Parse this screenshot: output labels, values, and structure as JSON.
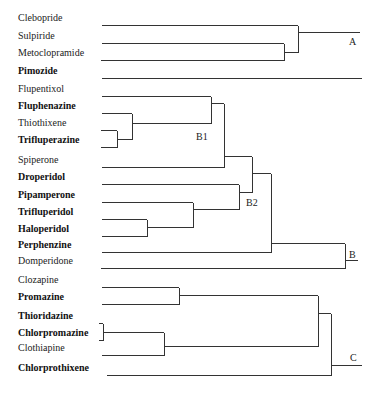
{
  "diagram": {
    "type": "dendrogram",
    "leaves": [
      {
        "name": "Clebopride",
        "bold": false,
        "y": 25
      },
      {
        "name": "Sulpiride",
        "bold": false,
        "y": 43
      },
      {
        "name": "Metoclopramide",
        "bold": false,
        "y": 60
      },
      {
        "name": "Pimozide",
        "bold": true,
        "y": 78
      },
      {
        "name": "Flupentixol",
        "bold": false,
        "y": 96
      },
      {
        "name": "Fluphenazine",
        "bold": true,
        "y": 113
      },
      {
        "name": "Thiothixene",
        "bold": false,
        "y": 130
      },
      {
        "name": "Trifluperazine",
        "bold": true,
        "y": 147
      },
      {
        "name": "Spiperone",
        "bold": false,
        "y": 167
      },
      {
        "name": "Droperidol",
        "bold": true,
        "y": 184
      },
      {
        "name": "Pipamperone",
        "bold": true,
        "y": 202
      },
      {
        "name": "Trifluperidol",
        "bold": true,
        "y": 219
      },
      {
        "name": "Haloperidol",
        "bold": true,
        "y": 236
      },
      {
        "name": "Perphenzine",
        "bold": true,
        "y": 252
      },
      {
        "name": "Domperidone",
        "bold": false,
        "y": 268
      },
      {
        "name": "Clozapine",
        "bold": false,
        "y": 287
      },
      {
        "name": "Promazine",
        "bold": true,
        "y": 304
      },
      {
        "name": "Thioridazine",
        "bold": true,
        "y": 323
      },
      {
        "name": "Chlorpromazine",
        "bold": true,
        "y": 340
      },
      {
        "name": "Clothiapine",
        "bold": false,
        "y": 355
      },
      {
        "name": "Chlorprothixene",
        "bold": true,
        "y": 375
      }
    ],
    "cluster_labels": [
      {
        "text": "A",
        "x": 349,
        "y": 45
      },
      {
        "text": "B1",
        "x": 196,
        "y": 140
      },
      {
        "text": "B2",
        "x": 246,
        "y": 206
      },
      {
        "text": "B",
        "x": 349,
        "y": 258
      },
      {
        "text": "C",
        "x": 350,
        "y": 361
      }
    ],
    "segments": [
      [
        102,
        25,
        298,
        25
      ],
      [
        102,
        43,
        284,
        43
      ],
      [
        101,
        60,
        284,
        60
      ],
      [
        284,
        43,
        284,
        60
      ],
      [
        284,
        52,
        298,
        52
      ],
      [
        298,
        25,
        298,
        52
      ],
      [
        298,
        32,
        360,
        32
      ],
      [
        102,
        78,
        362,
        78
      ],
      [
        102,
        96,
        211,
        96
      ],
      [
        102,
        113,
        132,
        113
      ],
      [
        101,
        130,
        117,
        130
      ],
      [
        101,
        147,
        117,
        147
      ],
      [
        117,
        130,
        117,
        147
      ],
      [
        117,
        139,
        132,
        139
      ],
      [
        132,
        113,
        132,
        139
      ],
      [
        132,
        123,
        211,
        123
      ],
      [
        211,
        96,
        211,
        123
      ],
      [
        211,
        103,
        224,
        103
      ],
      [
        102,
        167,
        224,
        167
      ],
      [
        224,
        103,
        224,
        167
      ],
      [
        224,
        156,
        252,
        156
      ],
      [
        102,
        184,
        239,
        184
      ],
      [
        102,
        202,
        193,
        202
      ],
      [
        102,
        219,
        147,
        219
      ],
      [
        102,
        236,
        147,
        236
      ],
      [
        147,
        219,
        147,
        236
      ],
      [
        147,
        227,
        193,
        227
      ],
      [
        193,
        202,
        193,
        227
      ],
      [
        193,
        209,
        239,
        209
      ],
      [
        239,
        184,
        239,
        209
      ],
      [
        239,
        192,
        252,
        192
      ],
      [
        252,
        156,
        252,
        192
      ],
      [
        252,
        173,
        271,
        173
      ],
      [
        102,
        252,
        271,
        252
      ],
      [
        271,
        173,
        271,
        252
      ],
      [
        271,
        243,
        345,
        243
      ],
      [
        101,
        268,
        345,
        268
      ],
      [
        345,
        243,
        345,
        268
      ],
      [
        345,
        260,
        358,
        260
      ],
      [
        102,
        287,
        179,
        287
      ],
      [
        102,
        304,
        179,
        304
      ],
      [
        179,
        287,
        179,
        304
      ],
      [
        179,
        295,
        318,
        295
      ],
      [
        99,
        323,
        103,
        323
      ],
      [
        99,
        340,
        103,
        340
      ],
      [
        103,
        323,
        103,
        340
      ],
      [
        103,
        332,
        164,
        332
      ],
      [
        102,
        355,
        164,
        355
      ],
      [
        164,
        332,
        164,
        355
      ],
      [
        164,
        346,
        318,
        346
      ],
      [
        318,
        295,
        318,
        346
      ],
      [
        318,
        313,
        331,
        313
      ],
      [
        107,
        375,
        331,
        375
      ],
      [
        331,
        313,
        331,
        375
      ],
      [
        331,
        365,
        362,
        365
      ]
    ]
  }
}
